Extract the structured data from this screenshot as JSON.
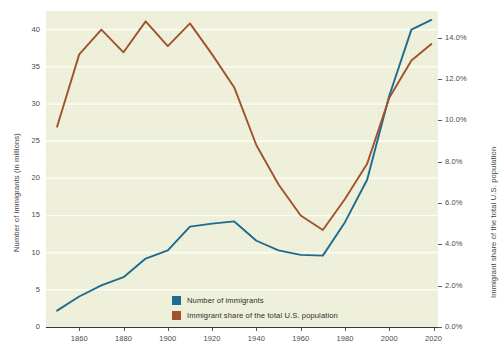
{
  "chart_data": {
    "type": "line",
    "title": "",
    "xlabel": "",
    "ylabel": "Number of immigrants (in millions)",
    "y2label": "Immigrant share of the total U.S. population",
    "xlim": [
      1845,
      2022
    ],
    "ylim": [
      0,
      42.5
    ],
    "y2lim": [
      0.0,
      15.3
    ],
    "grid": true,
    "legend_position": "inside-bottom-left",
    "x_ticks": [
      1860,
      1880,
      1900,
      1920,
      1940,
      1960,
      1980,
      2000,
      2020
    ],
    "x_tick_labels": [
      "1860",
      "1880",
      "1900",
      "1920",
      "1940",
      "1960",
      "1980",
      "2000",
      "2020"
    ],
    "y_ticks": [
      0,
      5,
      10,
      15,
      20,
      25,
      30,
      35,
      40
    ],
    "y_tick_labels": [
      "0",
      "5",
      "10",
      "15",
      "20",
      "25",
      "30",
      "35",
      "40"
    ],
    "y2_ticks": [
      0.0,
      2.0,
      4.0,
      6.0,
      8.0,
      10.0,
      12.0,
      14.0
    ],
    "y2_tick_labels": [
      "0.0%",
      "2.0%",
      "4.0%",
      "6.0%",
      "8.0%",
      "10.0%",
      "12.0%",
      "14.0%"
    ],
    "x": [
      1850,
      1860,
      1870,
      1880,
      1890,
      1900,
      1910,
      1920,
      1930,
      1940,
      1950,
      1960,
      1970,
      1980,
      1990,
      2000,
      2010,
      2019
    ],
    "series": [
      {
        "name": "Number of immigrants",
        "axis": "left",
        "color": "#1d6c8f",
        "values": [
          2.2,
          4.1,
          5.6,
          6.7,
          9.2,
          10.3,
          13.5,
          13.9,
          14.2,
          11.6,
          10.3,
          9.7,
          9.6,
          14.1,
          19.8,
          31.1,
          40.0,
          41.3
        ]
      },
      {
        "name": "Immigrant share of the total U.S. population",
        "axis": "right",
        "color": "#a1512f",
        "values": [
          9.7,
          13.2,
          14.4,
          13.3,
          14.8,
          13.6,
          14.7,
          13.2,
          11.6,
          8.8,
          6.9,
          5.4,
          4.7,
          6.2,
          7.9,
          11.1,
          12.9,
          13.7
        ]
      }
    ]
  },
  "legend": {
    "items": [
      {
        "label": "Number of immigrants",
        "color": "#1d6c8f"
      },
      {
        "label": "Immigrant share of the total U.S. population",
        "color": "#a1512f"
      }
    ]
  },
  "axes": {
    "left_title": "Number of immigrants (in millions)",
    "right_title": "Immigrant share of the total U.S. population"
  }
}
